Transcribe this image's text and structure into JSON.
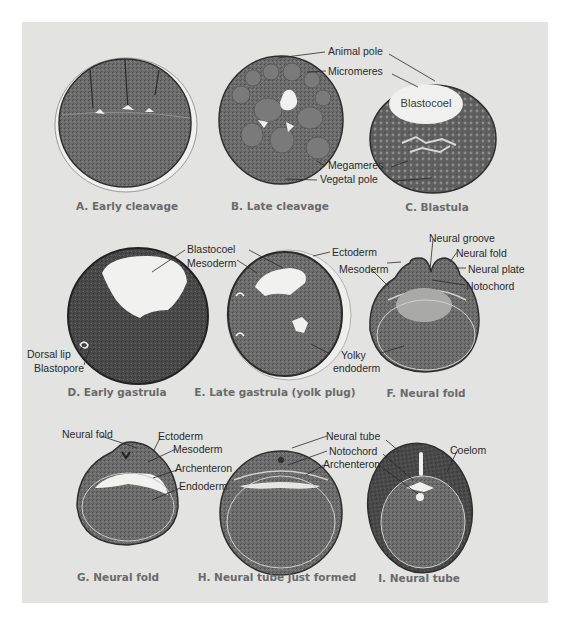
{
  "figure": {
    "colors": {
      "page_background": "#ffffff",
      "panel_background": "#e3e3e1",
      "tissue_dark": "#3e3e3e",
      "tissue_mid": "#6b6b6b",
      "tissue_light": "#8a8a8a",
      "cavity": "#f1f1ef",
      "label_text": "#2a2a2a",
      "caption_text": "#6a6a6a"
    },
    "panels": [
      {
        "id": "A",
        "caption": "A. Early cleavage",
        "labels": []
      },
      {
        "id": "B",
        "caption": "B. Late cleavage",
        "labels": [
          "Animal pole",
          "Micromeres",
          "Megameres",
          "Vegetal pole"
        ]
      },
      {
        "id": "C",
        "caption": "C. Blastula",
        "inner_label": "Blastocoel",
        "labels": []
      },
      {
        "id": "D",
        "caption": "D. Early gastrula",
        "labels": [
          "Blastocoel",
          "Dorsal lip",
          "Blastopore"
        ]
      },
      {
        "id": "E",
        "caption": "E. Late gastrula (yolk plug)",
        "labels": [
          "Mesoderm",
          "Ectoderm",
          "Yolky",
          "endoderm"
        ]
      },
      {
        "id": "F",
        "caption": "F. Neural fold",
        "labels": [
          "Neural groove",
          "Neural fold",
          "Mesoderm",
          "Neural plate",
          "Notochord"
        ]
      },
      {
        "id": "G",
        "caption": "G. Neural fold",
        "labels": [
          "Neural fold",
          "Ectoderm",
          "Mesoderm",
          "Archenteron",
          "Endoderm"
        ]
      },
      {
        "id": "H",
        "caption": "H. Neural tube just formed",
        "labels": [
          "Neural tube",
          "Notochord",
          "Archenteron"
        ]
      },
      {
        "id": "I",
        "caption": "I. Neural tube",
        "labels": [
          "Coelom"
        ]
      }
    ]
  }
}
